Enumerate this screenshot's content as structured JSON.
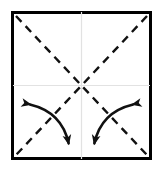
{
  "figure": {
    "kind": "origami-fold-instruction-diagram",
    "canvas": {
      "width": 163,
      "height": 171,
      "background": "#ffffff"
    }
  },
  "colors": {
    "ink": "#111111",
    "border": "#000000",
    "crease": "#111111",
    "guide": "#e2e2e2",
    "paper": "#ffffff"
  },
  "paper": {
    "label": "square-sheet",
    "x": 11,
    "y": 11,
    "width": 141,
    "height": 149,
    "border_width": 3,
    "border_color": "#000000",
    "fill": "#ffffff"
  },
  "guides": {
    "label": "center-cross-guides",
    "stroke": "#e2e2e2",
    "stroke_width": 1.2,
    "vertical": {
      "x": 81.5,
      "y1": 12,
      "y2": 159
    },
    "horizontal": {
      "y": 85.5,
      "x1": 13,
      "x2": 150
    }
  },
  "creases": {
    "label": "diagonal-crease-lines",
    "style": "dashed",
    "stroke": "#111111",
    "stroke_width": 2.4,
    "dash_length": 8,
    "gap_length": 6,
    "lines": [
      {
        "name": "crease-main-diagonal",
        "x1": 16,
        "y1": 16,
        "x2": 147,
        "y2": 155
      },
      {
        "name": "crease-anti-diagonal",
        "x1": 147,
        "y1": 16,
        "x2": 16,
        "y2": 155
      }
    ]
  },
  "arrows": {
    "label": "rotation-arrows",
    "stroke": "#111111",
    "stroke_width": 2.6,
    "head_length": 11,
    "head_width": 9,
    "items": [
      {
        "name": "arrow-bottom-left",
        "quadrant": "bottom-left",
        "double_headed": true,
        "start": {
          "x": 24,
          "y": 103
        },
        "control": {
          "x": 62,
          "y": 112
        },
        "end": {
          "x": 70,
          "y": 150
        },
        "start_head_direction": "up-left",
        "end_head_direction": "down"
      },
      {
        "name": "arrow-bottom-right",
        "quadrant": "bottom-right",
        "double_headed": true,
        "start": {
          "x": 139,
          "y": 103
        },
        "control": {
          "x": 101,
          "y": 112
        },
        "end": {
          "x": 93,
          "y": 150
        },
        "start_head_direction": "up-right",
        "end_head_direction": "down"
      }
    ]
  }
}
